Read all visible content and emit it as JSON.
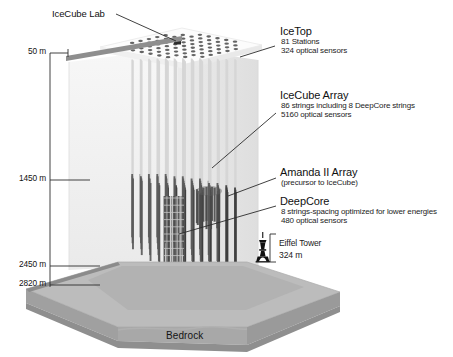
{
  "figure": {
    "name": "IceCube Neutrino Observatory cutaway diagram",
    "bedrock_label": "Bedrock"
  },
  "callouts": {
    "icecube_lab": {
      "title": "IceCube Lab"
    },
    "icetop": {
      "title": "IceTop",
      "line1": "81 Stations",
      "line2": "324 optical sensors"
    },
    "icecube_array": {
      "title": "IceCube Array",
      "line1": "86 strings including 8 DeepCore strings",
      "line2": "5160 optical sensors"
    },
    "amanda": {
      "title": "Amanda II Array",
      "line1": "(precursor to IceCube)"
    },
    "deepcore": {
      "title": "DeepCore",
      "line1": "8 strings-spacing optimized for lower energies",
      "line2": "480 optical sensors"
    },
    "eiffel": {
      "title": "Eiffel Tower",
      "line1": "324 m"
    }
  },
  "depth_scale": {
    "ticks": [
      {
        "label": "50 m"
      },
      {
        "label": "1450 m"
      },
      {
        "label": "2450 m"
      },
      {
        "label": "2820 m"
      }
    ]
  },
  "colors": {
    "ink": "#1a1a1a",
    "leader_line": "#2b2b2b",
    "ice_volume": "#f2f2f2",
    "ice_volume_right": "#e6e6e6",
    "icetop_surface": "#fbfbfb",
    "icetop_dot": "#4f4f4f",
    "lab_marker": "#2a2a2a",
    "cable_light": "#d6d6d6",
    "string_dark": "#5b5b5b",
    "string_darker": "#3f3f3f",
    "deepcore_cluster": "#4a4a4a",
    "bedrock_top": "#b9b9b9",
    "bedrock_face": "#a5a5a5",
    "bedrock_front": "#9a9a9a",
    "bedrock_edge": "#8d8d8d",
    "depth_bar": "#8c8c8c"
  },
  "icons": {
    "eiffel_tower": "eiffel-tower-silhouette",
    "icetop_station": "icetop-station-dot",
    "lab": "icecube-lab-marker"
  }
}
